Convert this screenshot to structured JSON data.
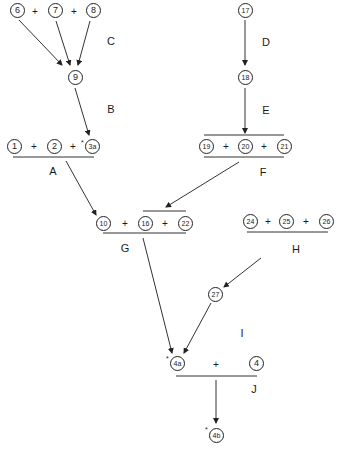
{
  "diagram": {
    "type": "reaction-scheme",
    "nodes": [
      {
        "id": "6",
        "label": "6"
      },
      {
        "id": "7",
        "label": "7"
      },
      {
        "id": "8",
        "label": "8"
      },
      {
        "id": "9",
        "label": "9"
      },
      {
        "id": "17",
        "label": "17"
      },
      {
        "id": "18",
        "label": "18"
      },
      {
        "id": "1",
        "label": "1"
      },
      {
        "id": "2",
        "label": "2"
      },
      {
        "id": "3a",
        "label": "3a",
        "starred": true
      },
      {
        "id": "19",
        "label": "19"
      },
      {
        "id": "20",
        "label": "20"
      },
      {
        "id": "21",
        "label": "21"
      },
      {
        "id": "10",
        "label": "10"
      },
      {
        "id": "16",
        "label": "16"
      },
      {
        "id": "22",
        "label": "22"
      },
      {
        "id": "24",
        "label": "24"
      },
      {
        "id": "25",
        "label": "25"
      },
      {
        "id": "26",
        "label": "26"
      },
      {
        "id": "27",
        "label": "27"
      },
      {
        "id": "4a",
        "label": "4a",
        "starred": true
      },
      {
        "id": "4",
        "label": "4"
      },
      {
        "id": "4b",
        "label": "4b",
        "starred": true
      }
    ],
    "steps": [
      {
        "label": "C",
        "from": [
          "6",
          "7",
          "8"
        ],
        "to": "9"
      },
      {
        "label": "B",
        "from": [
          "9"
        ],
        "to": "3a"
      },
      {
        "label": "D",
        "from": [
          "17"
        ],
        "to": "18"
      },
      {
        "label": "E",
        "from": [
          "18"
        ],
        "to": "20"
      },
      {
        "label": "A",
        "from": [
          "1",
          "2",
          "3a"
        ],
        "to": "10"
      },
      {
        "label": "F",
        "from": [
          "19",
          "20",
          "21"
        ],
        "to": "16"
      },
      {
        "label": "G",
        "from": [
          "10",
          "16",
          "22"
        ],
        "to": "4a"
      },
      {
        "label": "H",
        "from": [
          "24",
          "25",
          "26"
        ],
        "to": "27"
      },
      {
        "label": "I",
        "from": [
          "27"
        ],
        "to": "4a"
      },
      {
        "label": "J",
        "from": [
          "4a",
          "4"
        ],
        "to": "4b"
      }
    ],
    "plus_sign": "+",
    "star_mark": "*",
    "labels": {
      "A": "A",
      "B": "B",
      "C": "C",
      "D": "D",
      "E": "E",
      "F": "F",
      "G": "G",
      "H": "H",
      "I": "I",
      "J": "J"
    }
  }
}
